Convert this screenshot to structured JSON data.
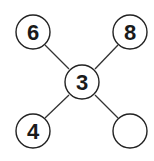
{
  "diagram": {
    "type": "star-number-puzzle",
    "center": {
      "label": "3"
    },
    "nodes": [
      {
        "position": "top-left",
        "label": "6"
      },
      {
        "position": "top-right",
        "label": "8"
      },
      {
        "position": "bottom-left",
        "label": "4"
      },
      {
        "position": "bottom-right",
        "label": ""
      }
    ],
    "colors": {
      "stroke": "#222222",
      "fill": "#ffffff",
      "text": "#1a1a1a"
    }
  }
}
